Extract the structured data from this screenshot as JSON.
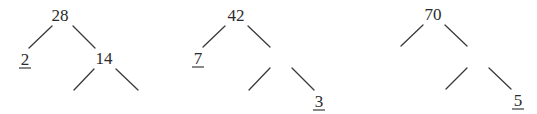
{
  "diagram": {
    "type": "factor-trees",
    "trees": [
      {
        "root": "28",
        "nodes": [
          {
            "id": "t1-root",
            "label": "28",
            "x": 60,
            "y": 21,
            "underlined": false
          },
          {
            "id": "t1-left",
            "label": "2",
            "x": 25,
            "y": 65,
            "underlined": true
          },
          {
            "id": "t1-right",
            "label": "14",
            "x": 104,
            "y": 64,
            "underlined": false
          },
          {
            "id": "t1-right-left",
            "label": "",
            "x": 72,
            "y": 104,
            "underlined": false
          },
          {
            "id": "t1-right-right",
            "label": "",
            "x": 140,
            "y": 104,
            "underlined": false
          }
        ],
        "edges": [
          {
            "x1": 52,
            "y1": 26,
            "x2": 29,
            "y2": 48
          },
          {
            "x1": 73,
            "y1": 26,
            "x2": 95,
            "y2": 48
          },
          {
            "x1": 94,
            "y1": 69,
            "x2": 74,
            "y2": 90
          },
          {
            "x1": 116,
            "y1": 69,
            "x2": 138,
            "y2": 90
          }
        ]
      },
      {
        "root": "42",
        "nodes": [
          {
            "id": "t2-root",
            "label": "42",
            "x": 236,
            "y": 21,
            "underlined": false
          },
          {
            "id": "t2-left",
            "label": "7",
            "x": 198,
            "y": 64,
            "underlined": true
          },
          {
            "id": "t2-right",
            "label": "",
            "x": 281,
            "y": 58,
            "underlined": false
          },
          {
            "id": "t2-right-left",
            "label": "",
            "x": 246,
            "y": 104,
            "underlined": false
          },
          {
            "id": "t2-right-right",
            "label": "3",
            "x": 319,
            "y": 107,
            "underlined": true
          }
        ],
        "edges": [
          {
            "x1": 225,
            "y1": 26,
            "x2": 203,
            "y2": 47
          },
          {
            "x1": 248,
            "y1": 26,
            "x2": 270,
            "y2": 47
          },
          {
            "x1": 270,
            "y1": 68,
            "x2": 249,
            "y2": 90
          },
          {
            "x1": 292,
            "y1": 68,
            "x2": 314,
            "y2": 90
          }
        ]
      },
      {
        "root": "70",
        "nodes": [
          {
            "id": "t3-root",
            "label": "70",
            "x": 433,
            "y": 20,
            "underlined": false
          },
          {
            "id": "t3-left",
            "label": "",
            "x": 398,
            "y": 58,
            "underlined": false
          },
          {
            "id": "t3-right",
            "label": "",
            "x": 478,
            "y": 58,
            "underlined": false
          },
          {
            "id": "t3-right-left",
            "label": "",
            "x": 443,
            "y": 103,
            "underlined": false
          },
          {
            "id": "t3-right-right",
            "label": "5",
            "x": 518,
            "y": 106,
            "underlined": true
          }
        ],
        "edges": [
          {
            "x1": 423,
            "y1": 25,
            "x2": 401,
            "y2": 46
          },
          {
            "x1": 445,
            "y1": 25,
            "x2": 467,
            "y2": 46
          },
          {
            "x1": 467,
            "y1": 68,
            "x2": 446,
            "y2": 89
          },
          {
            "x1": 489,
            "y1": 68,
            "x2": 511,
            "y2": 89
          }
        ]
      }
    ]
  },
  "labels": {
    "t1_root": "28",
    "t1_left": "2",
    "t1_right": "14",
    "t2_root": "42",
    "t2_left": "7",
    "t2_right_right": "3",
    "t3_root": "70",
    "t3_right_right": "5"
  },
  "colors": {
    "background": "#ffffff",
    "text": "#2b2b2b",
    "line": "#3a3a3a"
  }
}
